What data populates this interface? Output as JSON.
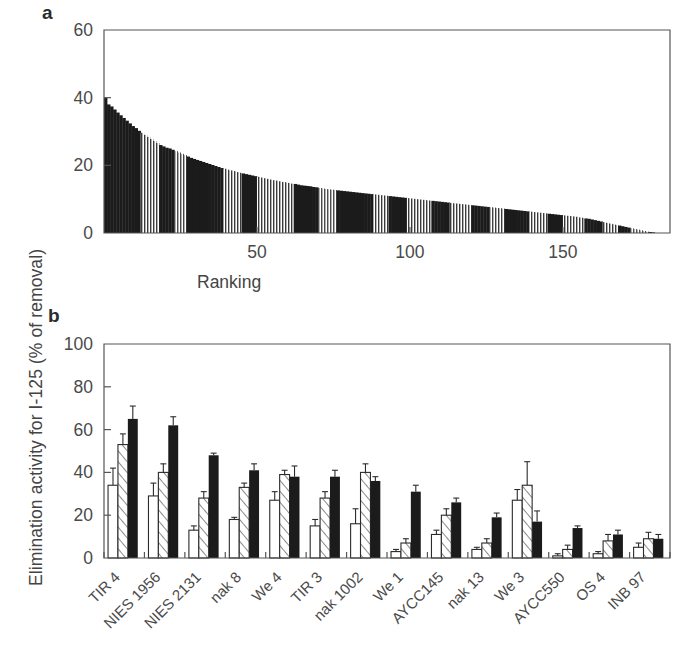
{
  "figure": {
    "y_axis_label": "Elimination activity for I-125  (% of removal)",
    "panel_a_letter": "a",
    "panel_b_letter": "b"
  },
  "chart_data": [
    {
      "type": "bar",
      "panel": "a",
      "title": "",
      "xlabel": "Ranking",
      "ylabel": "Elimination activity for I-125 (% of removal)",
      "xlim": [
        0,
        185
      ],
      "ylim": [
        0,
        60
      ],
      "yticks": [
        0,
        20,
        40,
        60
      ],
      "ytick_labels": [
        "0",
        "20",
        "40",
        "60"
      ],
      "xticks": [
        50,
        100,
        150
      ],
      "xtick_labels": [
        "50",
        "100",
        "150"
      ],
      "grid": false,
      "legend": "none",
      "n_bars": 182,
      "description": "Rank-ordered distribution of elimination activity of 182 strains, decreasing monotonically from about 40% to 0%.",
      "x": [
        1,
        2,
        3,
        4,
        5,
        6,
        7,
        8,
        9,
        10,
        11,
        12,
        13,
        14,
        15,
        16,
        17,
        18,
        19,
        20,
        21,
        22,
        23,
        24,
        25,
        26,
        27,
        28,
        29,
        30,
        31,
        32,
        33,
        34,
        35,
        36,
        37,
        38,
        39,
        40,
        41,
        42,
        43,
        44,
        45,
        46,
        47,
        48,
        49,
        50,
        51,
        52,
        53,
        54,
        55,
        56,
        57,
        58,
        59,
        60,
        61,
        62,
        63,
        64,
        65,
        66,
        67,
        68,
        69,
        70,
        71,
        72,
        73,
        74,
        75,
        76,
        77,
        78,
        79,
        80,
        81,
        82,
        83,
        84,
        85,
        86,
        87,
        88,
        89,
        90,
        91,
        92,
        93,
        94,
        95,
        96,
        97,
        98,
        99,
        100,
        101,
        102,
        103,
        104,
        105,
        106,
        107,
        108,
        109,
        110,
        111,
        112,
        113,
        114,
        115,
        116,
        117,
        118,
        119,
        120,
        121,
        122,
        123,
        124,
        125,
        126,
        127,
        128,
        129,
        130,
        131,
        132,
        133,
        134,
        135,
        136,
        137,
        138,
        139,
        140,
        141,
        142,
        143,
        144,
        145,
        146,
        147,
        148,
        149,
        150,
        151,
        152,
        153,
        154,
        155,
        156,
        157,
        158,
        159,
        160,
        161,
        162,
        163,
        164,
        165,
        166,
        167,
        168,
        169,
        170,
        171,
        172,
        173,
        174,
        175,
        176,
        177,
        178,
        179,
        180,
        181,
        182
      ],
      "values": [
        40.0,
        38.0,
        37.4,
        36.5,
        35.6,
        34.8,
        34.0,
        33.2,
        32.4,
        31.6,
        31.0,
        30.2,
        29.6,
        29.0,
        28.4,
        27.8,
        27.2,
        26.6,
        26.0,
        25.6,
        25.2,
        25.0,
        24.6,
        24.2,
        23.8,
        23.4,
        23.0,
        22.6,
        22.2,
        21.9,
        21.6,
        21.3,
        21.0,
        20.7,
        20.4,
        20.1,
        19.8,
        19.5,
        19.2,
        19.0,
        18.7,
        18.5,
        18.3,
        18.0,
        17.8,
        17.6,
        17.4,
        17.2,
        17.0,
        16.8,
        16.6,
        16.4,
        16.2,
        16.0,
        15.8,
        15.6,
        15.5,
        15.3,
        15.1,
        15.0,
        14.8,
        14.6,
        14.5,
        14.3,
        14.1,
        14.0,
        13.9,
        13.8,
        13.6,
        13.5,
        13.3,
        13.2,
        13.0,
        12.9,
        12.8,
        12.7,
        12.6,
        12.5,
        12.4,
        12.3,
        12.2,
        12.1,
        12.0,
        11.9,
        11.8,
        11.7,
        11.6,
        11.5,
        11.4,
        11.3,
        11.2,
        11.1,
        11.0,
        10.9,
        10.8,
        10.7,
        10.6,
        10.5,
        10.4,
        10.3,
        10.2,
        10.1,
        10.0,
        9.9,
        9.8,
        9.7,
        9.6,
        9.5,
        9.4,
        9.3,
        9.2,
        9.1,
        9.0,
        8.9,
        8.8,
        8.7,
        8.6,
        8.5,
        8.4,
        8.3,
        8.2,
        8.1,
        8.0,
        7.9,
        7.8,
        7.7,
        7.6,
        7.5,
        7.4,
        7.3,
        7.2,
        7.1,
        7.0,
        6.9,
        6.8,
        6.7,
        6.6,
        6.5,
        6.4,
        6.3,
        6.2,
        6.1,
        6.0,
        5.9,
        5.8,
        5.7,
        5.6,
        5.5,
        5.4,
        5.3,
        5.2,
        5.1,
        5.0,
        4.9,
        4.8,
        4.6,
        4.5,
        4.3,
        4.2,
        4.0,
        3.8,
        3.6,
        3.4,
        3.2,
        3.0,
        2.8,
        2.6,
        2.4,
        2.2,
        2.0,
        1.8,
        1.6,
        1.4,
        1.2,
        1.0,
        0.8,
        0.6,
        0.4,
        0.3,
        0.2
      ]
    },
    {
      "type": "bar",
      "panel": "b",
      "title": "",
      "xlabel": "",
      "ylabel": "Elimination activity for I-125 (% of removal)",
      "ylim": [
        0,
        100
      ],
      "yticks": [
        0,
        20,
        40,
        60,
        80,
        100
      ],
      "ytick_labels": [
        "0",
        "20",
        "40",
        "60",
        "80",
        "100"
      ],
      "grid": false,
      "legend": "none",
      "categories": [
        "TIR 4",
        "NIES 1956",
        "NIES 2131",
        "nak 8",
        "We 4",
        "TIR 3",
        "nak 1002",
        "We 1",
        "AYCC145",
        "nak 13",
        "We 3",
        "AYCC550",
        "OS 4",
        "INB 97"
      ],
      "series": [
        {
          "name": "open",
          "style": "white",
          "values": [
            34,
            29,
            13,
            18,
            27,
            15,
            16,
            3,
            11,
            4,
            27,
            1,
            2,
            5
          ],
          "errors": [
            8,
            6,
            2,
            1,
            4,
            3,
            7,
            1,
            2,
            1,
            5,
            1,
            1,
            2
          ]
        },
        {
          "name": "hatched",
          "style": "diagonal-hatch",
          "values": [
            53,
            40,
            28,
            33,
            39,
            28,
            40,
            7,
            20,
            7,
            34,
            4,
            8,
            9
          ],
          "errors": [
            5,
            4,
            3,
            2,
            2,
            3,
            4,
            2,
            3,
            2,
            11,
            2,
            3,
            3
          ]
        },
        {
          "name": "filled",
          "style": "black",
          "values": [
            65,
            62,
            48,
            41,
            38,
            38,
            36,
            31,
            26,
            19,
            17,
            14,
            11,
            9
          ],
          "errors": [
            6,
            4,
            1,
            3,
            5,
            3,
            2,
            3,
            2,
            2,
            5,
            1,
            2,
            2
          ]
        }
      ]
    }
  ]
}
